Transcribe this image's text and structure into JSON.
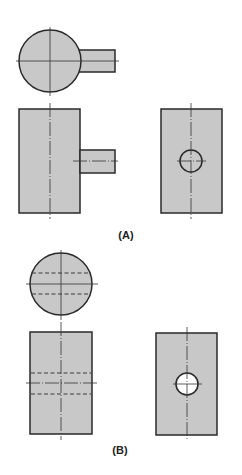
{
  "figure": {
    "colors": {
      "fill": "#c8c8c8",
      "stroke": "#2a2a2a",
      "centerline": "#333333",
      "hidden": "#3a3a3a",
      "hole": "#ffffff"
    },
    "panels": [
      {
        "id": "A",
        "label": "(A)",
        "description": "Cylinder with solid cylindrical peg protruding from side",
        "views": [
          "top-view",
          "front-view",
          "side-view"
        ]
      },
      {
        "id": "B",
        "label": "(B)",
        "description": "Cylinder with through-hole drilled across",
        "views": [
          "top-view",
          "front-view",
          "side-view"
        ]
      }
    ]
  }
}
